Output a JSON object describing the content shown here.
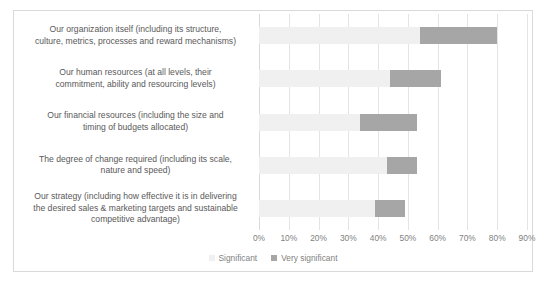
{
  "chart_data": {
    "type": "bar",
    "orientation": "horizontal",
    "stacked": true,
    "title": "",
    "xlabel": "",
    "ylabel": "",
    "xlim": [
      0,
      90
    ],
    "grid": true,
    "legend_position": "bottom",
    "categories": [
      "Our organization itself (including its structure, culture, metrics, processes and reward mechanisms)",
      "Our human resources (at all levels, their commitment, ability and resourcing levels)",
      "Our financial resources (including the size and timing of budgets allocated)",
      "The degree of change required (including its scale, nature and speed)",
      "Our strategy (including how effective it is in delivering the desired sales & marketing targets and sustainable competitive advantage)"
    ],
    "tick_labels": [
      "0%",
      "10%",
      "20%",
      "30%",
      "40%",
      "50%",
      "60%",
      "70%",
      "80%",
      "90%"
    ],
    "tick_values": [
      0,
      10,
      20,
      30,
      40,
      50,
      60,
      70,
      80,
      90
    ],
    "series": [
      {
        "name": "Significant",
        "color": "#f0f0f0",
        "values": [
          54,
          44,
          34,
          43,
          39
        ]
      },
      {
        "name": "Very significant",
        "color": "#a6a6a6",
        "values": [
          26,
          17,
          19,
          10,
          10
        ]
      }
    ]
  },
  "legend": [
    {
      "label": "Significant",
      "color": "#f0f0f0"
    },
    {
      "label": "Very significant",
      "color": "#a6a6a6"
    }
  ],
  "categories": [
    {
      "lines": [
        "Our organization itself (including its structure,",
        "culture, metrics, processes and reward mechanisms)"
      ]
    },
    {
      "lines": [
        "Our human resources (at all levels, their",
        "commitment, ability and resourcing levels)"
      ]
    },
    {
      "lines": [
        "Our financial resources (including the size and",
        "timing of budgets allocated)"
      ]
    },
    {
      "lines": [
        "The degree of change required (including its scale,",
        "nature and speed)"
      ]
    },
    {
      "lines": [
        "Our strategy (including how effective it is in delivering",
        "the desired sales & marketing targets and sustainable",
        "competitive advantage)"
      ]
    }
  ]
}
